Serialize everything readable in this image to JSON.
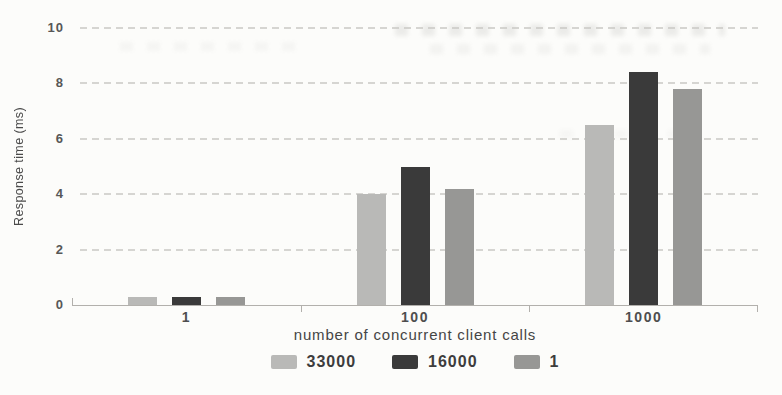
{
  "chart_data": {
    "type": "bar",
    "title": "",
    "xlabel": "number of concurrent client calls",
    "ylabel": "Response time (ms)",
    "categories": [
      "1",
      "100",
      "1000"
    ],
    "series": [
      {
        "name": "33000",
        "color": "#b9b9b7",
        "values": [
          0.3,
          4.0,
          6.5
        ]
      },
      {
        "name": "16000",
        "color": "#3a3a3a",
        "values": [
          0.3,
          5.0,
          8.4
        ]
      },
      {
        "name": "1",
        "color": "#979795",
        "values": [
          0.3,
          4.2,
          7.8
        ]
      }
    ],
    "ylim": [
      0,
      10
    ],
    "yticks": [
      0,
      2,
      4,
      6,
      8,
      10
    ],
    "grid": "horizontal-dashed",
    "legend_position": "bottom"
  },
  "colors": {
    "background": "#fcfcfa",
    "axis": "#b2b0ac",
    "gridline": "#c9c8c4",
    "tick_text": "#575757",
    "label_text": "#454545",
    "legend_text": "#3d3d3d"
  }
}
